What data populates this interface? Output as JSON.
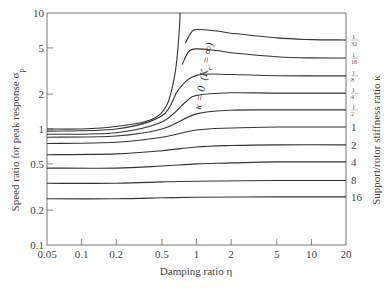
{
  "chart_data": {
    "type": "line",
    "title": "",
    "xlabel": "Damping ratio η",
    "ylabel": "Speed ratio for peak response σp",
    "right_label": "Support/rotor stiffness ratio κ",
    "x_scale": "log",
    "y_scale": "log",
    "xlim": [
      0.05,
      20
    ],
    "ylim": [
      0.1,
      10
    ],
    "x_ticks": [
      0.05,
      0.1,
      0.2,
      0.5,
      1,
      2,
      5,
      10,
      20
    ],
    "x_tick_labels": [
      "0.05",
      "0.1",
      "0.2",
      "0.5",
      "1",
      "2",
      "5",
      "10",
      "20"
    ],
    "y_ticks": [
      0.1,
      0.2,
      0.5,
      1,
      2,
      5,
      10
    ],
    "y_tick_labels": [
      "0.1",
      "0.2",
      "0.5",
      "1",
      "2",
      "5",
      "10"
    ],
    "grid": false,
    "annotation": "κ = 0  (Kₛ = ∞)",
    "x": [
      0.05,
      0.1,
      0.2,
      0.5,
      0.8,
      1,
      1.5,
      2,
      5,
      10,
      20
    ],
    "series": [
      {
        "name": "κ = 0",
        "label": "0",
        "points": [
          [
            0.05,
            1.0
          ],
          [
            0.1,
            1.0
          ],
          [
            0.2,
            1.05
          ],
          [
            0.4,
            1.2
          ],
          [
            0.55,
            1.6
          ],
          [
            0.65,
            3
          ],
          [
            0.7,
            6
          ],
          [
            0.72,
            10
          ]
        ]
      },
      {
        "name": "κ = 1/32",
        "label": "1/32",
        "points": [
          [
            0.8,
            5.5
          ],
          [
            0.9,
            6.8
          ],
          [
            1.0,
            7.2
          ],
          [
            1.5,
            7.0
          ],
          [
            2,
            6.7
          ],
          [
            5,
            6.1
          ],
          [
            10,
            5.9
          ],
          [
            20,
            5.85
          ]
        ]
      },
      {
        "name": "κ = 1/16",
        "label": "1/16",
        "points": [
          [
            0.75,
            3.6
          ],
          [
            0.85,
            4.6
          ],
          [
            1.0,
            4.9
          ],
          [
            1.5,
            4.75
          ],
          [
            2,
            4.55
          ],
          [
            5,
            4.2
          ],
          [
            10,
            4.1
          ],
          [
            20,
            4.09
          ]
        ]
      },
      {
        "name": "κ = 1/8",
        "label": "1/8",
        "points": [
          [
            0.05,
            0.96
          ],
          [
            0.2,
            1.0
          ],
          [
            0.5,
            1.3
          ],
          [
            0.7,
            2.2
          ],
          [
            1.0,
            2.9
          ],
          [
            2,
            2.95
          ],
          [
            5,
            2.88
          ],
          [
            20,
            2.87
          ]
        ]
      },
      {
        "name": "κ = 1/4",
        "label": "1/4",
        "points": [
          [
            0.05,
            0.9
          ],
          [
            0.2,
            0.93
          ],
          [
            0.5,
            1.15
          ],
          [
            0.8,
            1.7
          ],
          [
            1.0,
            1.95
          ],
          [
            2,
            2.05
          ],
          [
            5,
            2.04
          ],
          [
            20,
            2.04
          ]
        ]
      },
      {
        "name": "κ = 1/2",
        "label": "1/2",
        "points": [
          [
            0.05,
            0.85
          ],
          [
            0.2,
            0.87
          ],
          [
            0.5,
            1.0
          ],
          [
            1.0,
            1.35
          ],
          [
            2,
            1.45
          ],
          [
            5,
            1.46
          ],
          [
            20,
            1.46
          ]
        ]
      },
      {
        "name": "κ = 1",
        "label": "1",
        "points": [
          [
            0.05,
            0.75
          ],
          [
            0.2,
            0.77
          ],
          [
            0.5,
            0.85
          ],
          [
            1.0,
            0.98
          ],
          [
            2,
            1.02
          ],
          [
            5,
            1.04
          ],
          [
            20,
            1.04
          ]
        ]
      },
      {
        "name": "κ = 2",
        "label": "2",
        "points": [
          [
            0.05,
            0.6
          ],
          [
            0.2,
            0.61
          ],
          [
            0.5,
            0.65
          ],
          [
            1.0,
            0.7
          ],
          [
            2,
            0.72
          ],
          [
            5,
            0.73
          ],
          [
            20,
            0.73
          ]
        ]
      },
      {
        "name": "κ = 4",
        "label": "4",
        "points": [
          [
            0.05,
            0.46
          ],
          [
            0.2,
            0.46
          ],
          [
            0.5,
            0.48
          ],
          [
            1.0,
            0.5
          ],
          [
            2,
            0.51
          ],
          [
            5,
            0.52
          ],
          [
            20,
            0.52
          ]
        ]
      },
      {
        "name": "κ = 8",
        "label": "8",
        "points": [
          [
            0.05,
            0.34
          ],
          [
            0.2,
            0.34
          ],
          [
            0.5,
            0.35
          ],
          [
            1.0,
            0.355
          ],
          [
            5,
            0.36
          ],
          [
            20,
            0.36
          ]
        ]
      },
      {
        "name": "κ = 16",
        "label": "16",
        "points": [
          [
            0.05,
            0.25
          ],
          [
            0.2,
            0.25
          ],
          [
            0.5,
            0.255
          ],
          [
            1.0,
            0.258
          ],
          [
            5,
            0.26
          ],
          [
            20,
            0.26
          ]
        ]
      }
    ],
    "right_curve_labels": [
      "1/32",
      "1/16",
      "1/8",
      "1/4",
      "1/2",
      "1",
      "2",
      "4",
      "8",
      "16"
    ]
  },
  "labels": {
    "xlabel": "Damping ratio η",
    "ylabel": "Speed ratio for peak response σ",
    "ylabel_sub": "p",
    "right_label": "Support/rotor stiffness ratio κ",
    "annotation_main": "κ = 0",
    "annotation_paren": "(K",
    "annotation_sub": "r",
    "annotation_end": " = ∞)"
  }
}
